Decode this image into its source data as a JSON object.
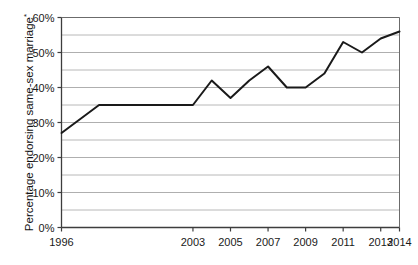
{
  "chart_data": {
    "type": "line",
    "title": "",
    "xlabel": "",
    "ylabel": "Percentage endorsing same-sex marriage",
    "ylabel_superscript": "*",
    "x": [
      1996,
      1998,
      2003,
      2004,
      2005,
      2006,
      2007,
      2008,
      2009,
      2010,
      2011,
      2012,
      2013,
      2014
    ],
    "values": [
      27,
      35,
      35,
      42,
      37,
      42,
      46,
      40,
      40,
      44,
      53,
      50,
      54,
      56
    ],
    "series": [
      {
        "name": "Percentage endorsing same-sex marriage",
        "values": [
          27,
          35,
          35,
          42,
          37,
          42,
          46,
          40,
          40,
          44,
          53,
          50,
          54,
          56
        ]
      }
    ],
    "xtick_labels": [
      "1996",
      "2003",
      "2005",
      "2007",
      "2009",
      "2011",
      "2013",
      "2014"
    ],
    "xtick_values": [
      1996,
      2003,
      2005,
      2007,
      2009,
      2011,
      2013,
      2014
    ],
    "ytick_labels": [
      "0%",
      "10%",
      "20%",
      "30%",
      "40%",
      "50%",
      "60%"
    ],
    "ytick_values": [
      0,
      10,
      20,
      30,
      40,
      50,
      60
    ],
    "yminor_values": [
      5,
      15,
      25,
      35,
      45,
      55
    ],
    "ylim": [
      0,
      60
    ],
    "xlim": [
      1996,
      2014
    ],
    "grid": "horizontal",
    "legend": "none",
    "line_color": "#1a1a1a",
    "grid_color": "#a6a6a6",
    "axis_color": "#4d4d4d",
    "background_color": "#ffffff"
  }
}
